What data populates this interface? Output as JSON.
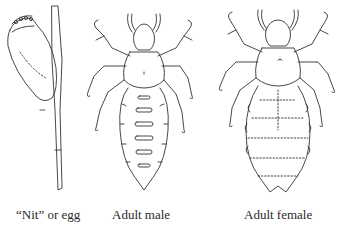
{
  "figure": {
    "panels": [
      {
        "id": "nit",
        "caption": "“Nit” or egg"
      },
      {
        "id": "male",
        "caption": "Adult male"
      },
      {
        "id": "female",
        "caption": "Adult female"
      }
    ],
    "line_color": "#333333",
    "background": "#ffffff"
  }
}
